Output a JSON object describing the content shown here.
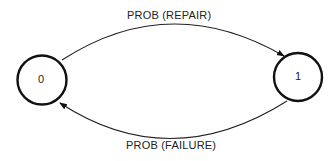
{
  "diagram": {
    "type": "state-transition",
    "nodes": [
      {
        "id": "0",
        "label": "0"
      },
      {
        "id": "1",
        "label": "1"
      }
    ],
    "edges": [
      {
        "from": "0",
        "to": "1",
        "label": "PROB (REPAIR)"
      },
      {
        "from": "1",
        "to": "0",
        "label": "PROB (FAILURE)"
      }
    ]
  }
}
